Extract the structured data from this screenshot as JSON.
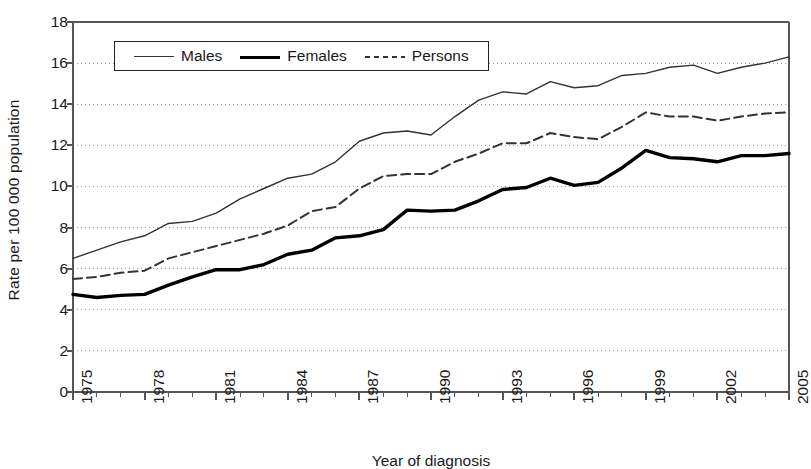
{
  "chart_data": {
    "type": "line",
    "title": "",
    "xlabel": "Year of diagnosis",
    "ylabel": "Rate per 100 000 population",
    "ylim": [
      0,
      18
    ],
    "ytick_step": 2,
    "yticks": [
      "18",
      "16",
      "14",
      "12",
      "10",
      "8",
      "6",
      "4",
      "2",
      "0"
    ],
    "grid": true,
    "grid_style": "dotted-horizontal",
    "legend_position": "top-left-inside",
    "xlim": [
      1975,
      2005
    ],
    "x": [
      1975,
      1976,
      1977,
      1978,
      1979,
      1980,
      1981,
      1982,
      1983,
      1984,
      1985,
      1986,
      1987,
      1988,
      1989,
      1990,
      1991,
      1992,
      1993,
      1994,
      1995,
      1996,
      1997,
      1998,
      1999,
      2000,
      2001,
      2002,
      2003,
      2004,
      2005
    ],
    "xtick_labels": [
      "1975",
      "1978",
      "1981",
      "1984",
      "1987",
      "1990",
      "1993",
      "1996",
      "1999",
      "2002",
      "2005"
    ],
    "xtick_values": [
      1975,
      1978,
      1981,
      1984,
      1987,
      1990,
      1993,
      1996,
      1999,
      2002,
      2005
    ],
    "series": [
      {
        "name": "Males",
        "style": "thin-solid",
        "color": "#333333",
        "values": [
          6.5,
          6.9,
          7.3,
          7.6,
          8.2,
          8.3,
          8.7,
          9.4,
          9.9,
          10.4,
          10.6,
          11.2,
          12.2,
          12.6,
          12.7,
          12.5,
          13.4,
          14.2,
          14.6,
          14.5,
          15.1,
          14.8,
          14.9,
          15.4,
          15.5,
          15.8,
          15.9,
          15.5,
          15.8,
          16.0,
          16.3
        ]
      },
      {
        "name": "Females",
        "style": "thick-solid",
        "color": "#000000",
        "values": [
          4.75,
          4.6,
          4.7,
          4.75,
          5.2,
          5.6,
          5.95,
          5.95,
          6.2,
          6.7,
          6.9,
          7.5,
          7.6,
          7.9,
          8.85,
          8.8,
          8.85,
          9.3,
          9.85,
          9.95,
          10.4,
          10.05,
          10.2,
          10.9,
          11.75,
          11.4,
          11.35,
          11.2,
          11.5,
          11.5,
          11.6
        ]
      },
      {
        "name": "Persons",
        "style": "dashed",
        "color": "#333333",
        "values": [
          5.5,
          5.6,
          5.8,
          5.9,
          6.5,
          6.8,
          7.1,
          7.4,
          7.7,
          8.1,
          8.8,
          9.0,
          9.9,
          10.5,
          10.6,
          10.6,
          11.2,
          11.6,
          12.1,
          12.1,
          12.6,
          12.4,
          12.3,
          12.9,
          13.6,
          13.4,
          13.4,
          13.2,
          13.4,
          13.55,
          13.6
        ]
      }
    ]
  },
  "legend": {
    "entries": [
      {
        "label": "Males"
      },
      {
        "label": "Females"
      },
      {
        "label": "Persons"
      }
    ]
  }
}
